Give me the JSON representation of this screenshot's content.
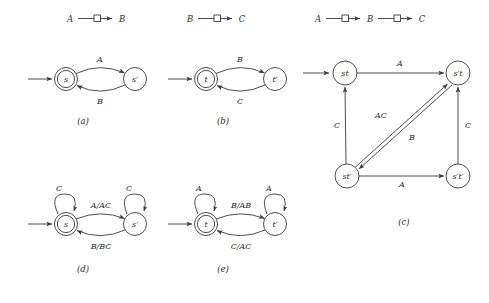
{
  "figure": {
    "headers": [
      {
        "id": "hdr-a",
        "text_left": "A",
        "text_mid": "□",
        "text_right": "B",
        "full": "A —□→ B"
      },
      {
        "id": "hdr-b",
        "text_left": "B",
        "text_mid": "□",
        "text_right": "C",
        "full": "B —□→ C"
      },
      {
        "id": "hdr-c",
        "text_left": "A",
        "text_mid": "□",
        "text_right": "B",
        "text_mid2": "□",
        "text_right2": "C",
        "full": "A —□→ B —□→ C"
      }
    ],
    "captions": {
      "a": "(a)",
      "b": "(b)",
      "c": "(c)",
      "d": "(d)",
      "e": "(e)"
    },
    "panels": {
      "a": {
        "caption": "(a)",
        "states": [
          {
            "name": "s",
            "accepting": true,
            "initial": true
          },
          {
            "name": "s′",
            "accepting": false,
            "initial": false
          }
        ],
        "transitions": [
          {
            "from": "s",
            "to": "s′",
            "label": "A"
          },
          {
            "from": "s′",
            "to": "s",
            "label": "B"
          }
        ]
      },
      "b": {
        "caption": "(b)",
        "states": [
          {
            "name": "t",
            "accepting": true,
            "initial": true
          },
          {
            "name": "t′",
            "accepting": false,
            "initial": false
          }
        ],
        "transitions": [
          {
            "from": "t",
            "to": "t′",
            "label": "B"
          },
          {
            "from": "t′",
            "to": "t",
            "label": "C"
          }
        ]
      },
      "c": {
        "caption": "(c)",
        "states": [
          {
            "name": "st",
            "initial": true
          },
          {
            "name": "s′t",
            "initial": false
          },
          {
            "name": "st′",
            "initial": false
          },
          {
            "name": "s′t′",
            "initial": false
          }
        ],
        "transitions": [
          {
            "from": "st",
            "to": "s′t",
            "label": "A"
          },
          {
            "from": "st′",
            "to": "st",
            "label": "C"
          },
          {
            "from": "s′t′",
            "to": "s′t",
            "label": "C"
          },
          {
            "from": "st′",
            "to": "s′t′",
            "label": "A"
          },
          {
            "from": "st′",
            "to": "s′t",
            "label": "AC"
          },
          {
            "from": "s′t",
            "to": "st′",
            "label": "B"
          }
        ]
      },
      "d": {
        "caption": "(d)",
        "states": [
          {
            "name": "s",
            "accepting": true,
            "initial": true
          },
          {
            "name": "s′",
            "accepting": false,
            "initial": false
          }
        ],
        "selfloops": [
          {
            "state": "s",
            "label": "C"
          },
          {
            "state": "s′",
            "label": "C"
          }
        ],
        "transitions": [
          {
            "from": "s",
            "to": "s′",
            "label": "A/AC"
          },
          {
            "from": "s′",
            "to": "s",
            "label": "B/BC"
          }
        ]
      },
      "e": {
        "caption": "(e)",
        "states": [
          {
            "name": "t",
            "accepting": true,
            "initial": true
          },
          {
            "name": "t′",
            "accepting": false,
            "initial": false
          }
        ],
        "selfloops": [
          {
            "state": "t",
            "label": "A"
          },
          {
            "state": "t′",
            "label": "A"
          }
        ],
        "transitions": [
          {
            "from": "t",
            "to": "t′",
            "label": "B/AB"
          },
          {
            "from": "t′",
            "to": "t",
            "label": "C/AC"
          }
        ]
      }
    },
    "colors": {
      "stroke": "#3a3a3a",
      "text": "#2a2a2a",
      "background": "#ffffff"
    }
  }
}
